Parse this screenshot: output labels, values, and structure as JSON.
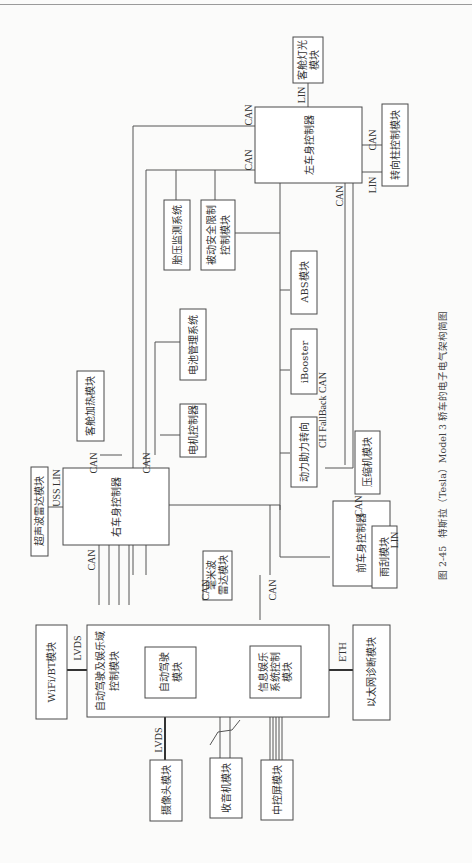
{
  "caption": {
    "figure_number": "图 2-45",
    "title": "特斯拉（Tesla）Model 3 轿车的电子电气架构简图"
  },
  "modules": {
    "cabin_light": "客舱灯光模块",
    "cabin_light_l1": "客舱灯光",
    "cabin_light_l2": "模块",
    "left_body_controller": "左车身控制器",
    "steering_column": "转向柱控制模块",
    "tpms": "胎压监测系统",
    "passive_safety": "被动安全限制控制模块",
    "passive_safety_l1": "被动安全限制",
    "passive_safety_l2": "控制模块",
    "abs": "ABS模块",
    "battery_mgmt": "电池管理系统",
    "ibooster": "iBooster",
    "motor_controller": "电机控制器",
    "power_steering": "动力助力转向",
    "cabin_heating": "客舱加热模块",
    "ultrasonic_radar": "超声波雷达模块",
    "right_body_controller": "右车身控制器",
    "mmwave_radar_l1": "毫米波",
    "mmwave_radar_l2": "雷达模块",
    "front_body_controller": "前车身控制器",
    "compressor": "压缩机模块",
    "wiper": "雨刮模块",
    "adas_domain_l1": "自动驾驶及娱乐域",
    "adas_domain_l2": "控制模块",
    "autopilot_l1": "自动驾驶",
    "autopilot_l2": "模块",
    "infotainment_l1": "信息娱乐",
    "infotainment_l2": "系统控制",
    "infotainment_l3": "模块",
    "wifi_bt": "WiFi/BT模块",
    "camera": "摄像头模块",
    "radio": "收音机模块",
    "center_display": "中控屏模块",
    "eth_diag": "以太网诊断模块"
  },
  "buses": {
    "can": "CAN",
    "lin": "LIN",
    "uss_lin": "USS LIN",
    "lvds": "LVDS",
    "eth": "ETH",
    "ch_fallback_can": "CH FallBack CAN"
  }
}
